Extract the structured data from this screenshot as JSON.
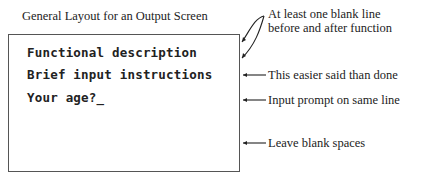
{
  "title": "General Layout for an Output Screen",
  "screen": {
    "lines": [
      "Functional description",
      "Brief input instructions",
      "Your age?_"
    ]
  },
  "annotations": [
    {
      "text_lines": [
        "At least one blank line",
        "before and after function"
      ]
    },
    {
      "text": "This easier said than done"
    },
    {
      "text": "Input prompt on same line"
    },
    {
      "text": "Leave blank spaces"
    }
  ]
}
